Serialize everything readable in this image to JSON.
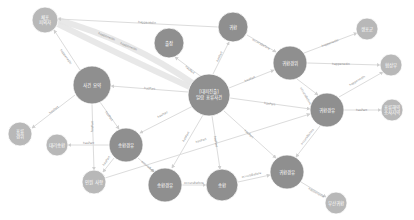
{
  "diagram": {
    "type": "knowledge-graph",
    "colors": {
      "background": "#ffffff",
      "major_node": "#8f8f8f",
      "minor_node": "#b8b8b8",
      "edge": "#dcdcdc",
      "edge_label": "#8a8a8a",
      "node_text": "#ffffff"
    },
    "nodes": [
      {
        "id": "A",
        "label1": "체포",
        "label2": "피의자",
        "kind": "small"
      },
      {
        "id": "B",
        "label1": "출장",
        "label2": "",
        "kind": "big"
      },
      {
        "id": "C",
        "label1": "귀환",
        "label2": "",
        "kind": "big"
      },
      {
        "id": "D",
        "label1": "[대피진출]",
        "label2": "일람 표류사건",
        "kind": "big"
      },
      {
        "id": "E",
        "label1": "사건 요약",
        "label2": "",
        "kind": "big"
      },
      {
        "id": "F",
        "label1": "표류",
        "label2": "경위",
        "kind": "small"
      },
      {
        "id": "G",
        "label1": "귀환경위",
        "label2": "",
        "kind": "big"
      },
      {
        "id": "H",
        "label1": "생포군",
        "label2": "",
        "kind": "small"
      },
      {
        "id": "I",
        "label1": "협상부",
        "label2": "",
        "kind": "small"
      },
      {
        "id": "J",
        "label1": "귀환경유",
        "label2": "",
        "kind": "big"
      },
      {
        "id": "K",
        "label1": "표류해역",
        "label2": "조사지역",
        "kind": "small"
      },
      {
        "id": "L",
        "label1": "송환경유",
        "label2": "",
        "kind": "big"
      },
      {
        "id": "M",
        "label1": "대리송환",
        "label2": "",
        "kind": "small"
      },
      {
        "id": "N",
        "label1": "인원 사항",
        "label2": "",
        "kind": "small"
      },
      {
        "id": "O",
        "label1": "송환경유",
        "label2": "",
        "kind": "big"
      },
      {
        "id": "P",
        "label1": "송환",
        "label2": "",
        "kind": "big"
      },
      {
        "id": "Q",
        "label1": "귀환경유",
        "label2": "",
        "kind": "big"
      },
      {
        "id": "R",
        "label1": "부산귀환",
        "label2": "",
        "kind": "small"
      }
    ],
    "edges": [
      {
        "from": "D",
        "to": "A",
        "label": "happenedIn"
      },
      {
        "from": "D",
        "to": "A",
        "label": "happenedIn"
      },
      {
        "from": "C",
        "to": "A",
        "label": "happenedIn"
      },
      {
        "from": "D",
        "to": "B",
        "label": "hasPart"
      },
      {
        "from": "D",
        "to": "C",
        "label": "hasPart"
      },
      {
        "from": "D",
        "to": "E",
        "label": "hasPart"
      },
      {
        "from": "E",
        "to": "A",
        "label": "happenedIn"
      },
      {
        "from": "E",
        "to": "F",
        "label": "hasPart"
      },
      {
        "from": "D",
        "to": "G",
        "label": "hasPart"
      },
      {
        "from": "C",
        "to": "G",
        "label": "occursBefore"
      },
      {
        "from": "G",
        "to": "H",
        "label": "happenedIn"
      },
      {
        "from": "G",
        "to": "I",
        "label": "happenedIn"
      },
      {
        "from": "G",
        "to": "J",
        "label": "occursBefore"
      },
      {
        "from": "D",
        "to": "J",
        "label": "hasPart"
      },
      {
        "from": "J",
        "to": "I",
        "label": "happenedIn"
      },
      {
        "from": "J",
        "to": "K",
        "label": "hasPart"
      },
      {
        "from": "E",
        "to": "L",
        "label": "hasPart"
      },
      {
        "from": "E",
        "to": "N",
        "label": "hasPart"
      },
      {
        "from": "L",
        "to": "M",
        "label": "hasPart"
      },
      {
        "from": "L",
        "to": "N",
        "label": "hasPart"
      },
      {
        "from": "L",
        "to": "O",
        "label": "occursBefore"
      },
      {
        "from": "D",
        "to": "L",
        "label": "hasPart"
      },
      {
        "from": "D",
        "to": "O",
        "label": "hasPart"
      },
      {
        "from": "D",
        "to": "P",
        "label": "hasPart"
      },
      {
        "from": "D",
        "to": "Q",
        "label": "hasPart"
      },
      {
        "from": "O",
        "to": "P",
        "label": "occursBefore"
      },
      {
        "from": "P",
        "to": "Q",
        "label": "occursBefore"
      },
      {
        "from": "J",
        "to": "Q",
        "label": "occursBefore"
      },
      {
        "from": "Q",
        "to": "R",
        "label": "happenedIn"
      },
      {
        "from": "N",
        "to": "J",
        "label": "hasPart"
      }
    ]
  }
}
